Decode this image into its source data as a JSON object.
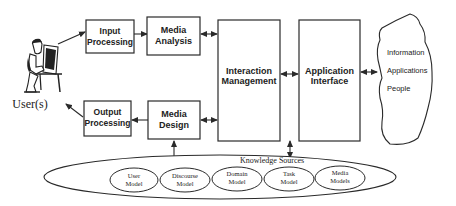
{
  "diagram": {
    "user": {
      "label": "User(s)",
      "icon": "person-at-computer-icon"
    },
    "boxes": {
      "input_processing": {
        "line1": "Input",
        "line2": "Processing"
      },
      "media_analysis": {
        "line1": "Media",
        "line2": "Analysis"
      },
      "interaction_management": {
        "line1": "Interaction",
        "line2": "Management"
      },
      "application_interface": {
        "line1": "Application",
        "line2": "Interface"
      },
      "output_processing": {
        "line1": "Output",
        "line2": "Processing"
      },
      "media_design": {
        "line1": "Media",
        "line2": "Design"
      }
    },
    "cloud": {
      "items": [
        "Information",
        "Applications",
        "People"
      ]
    },
    "knowledge": {
      "title": "Knowledge Sources",
      "models": [
        {
          "line1": "User",
          "line2": "Model"
        },
        {
          "line1": "Discourse",
          "line2": "Model"
        },
        {
          "line1": "Domain",
          "line2": "Model"
        },
        {
          "line1": "Task",
          "line2": "Model"
        },
        {
          "line1": "Media",
          "line2": "Models"
        }
      ]
    },
    "colors": {
      "stroke": "#2a2a2a",
      "background": "#ffffff"
    }
  }
}
